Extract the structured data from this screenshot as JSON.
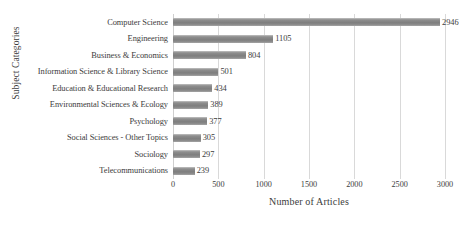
{
  "chart_data": {
    "type": "bar",
    "orientation": "horizontal",
    "title": "",
    "xlabel": "Number of Articles",
    "ylabel": "Subject Categories",
    "xlim": [
      0,
      3000
    ],
    "xticks": [
      0,
      500,
      1000,
      1500,
      2000,
      2500,
      3000
    ],
    "xtick_labels": [
      "0",
      "500",
      "1000",
      "1500",
      "2000",
      "2500",
      "3000"
    ],
    "grid": "vertical",
    "legend": "none",
    "bar_color": "#878787",
    "gridline_color": "#d9d9d9",
    "text_color": "#3c3c3c",
    "background": "#ffffff",
    "categories": [
      "Computer Science",
      "Engineering",
      "Business & Economics",
      "Information Science & Library Science",
      "Education & Educational Research",
      "Environmental Sciences & Ecology",
      "Psychology",
      "Social Sciences - Other Topics",
      "Sociology",
      "Telecommunications"
    ],
    "values": [
      2946,
      1105,
      804,
      501,
      434,
      389,
      377,
      305,
      297,
      239
    ],
    "data_labels": [
      "2946",
      "1105",
      "804",
      "501",
      "434",
      "389",
      "377",
      "305",
      "297",
      "239"
    ]
  }
}
